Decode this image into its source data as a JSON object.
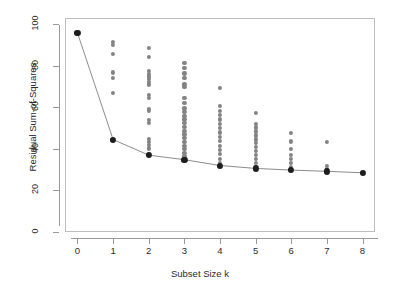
{
  "chart_data": {
    "type": "scatter",
    "title": "",
    "xlabel": "Subset Size k",
    "ylabel": "Residual Sum-of-Squares",
    "xlim": [
      -0.35,
      8.35
    ],
    "ylim": [
      0,
      103
    ],
    "grid": false,
    "legend": null,
    "xticks": [
      0,
      1,
      2,
      3,
      4,
      5,
      6,
      7,
      8
    ],
    "xtick_labels": [
      "0",
      "1",
      "2",
      "3",
      "4",
      "5",
      "6",
      "7",
      "8"
    ],
    "yticks": [
      0,
      20,
      40,
      60,
      80,
      100
    ],
    "ytick_labels": [
      "0",
      "20",
      "40",
      "60",
      "80",
      "100"
    ],
    "series": [
      {
        "name": "all-subsets-rss",
        "marker": "filled-circle",
        "color": "#838383",
        "points": [
          {
            "k": 0,
            "rss": 95.8
          },
          {
            "k": 1,
            "rss": 91.5
          },
          {
            "k": 1,
            "rss": 90.2
          },
          {
            "k": 1,
            "rss": 85.6
          },
          {
            "k": 1,
            "rss": 76.8
          },
          {
            "k": 1,
            "rss": 74.1
          },
          {
            "k": 1,
            "rss": 67.1
          },
          {
            "k": 1,
            "rss": 44.5
          },
          {
            "k": 2,
            "rss": 88.5
          },
          {
            "k": 2,
            "rss": 84.4
          },
          {
            "k": 2,
            "rss": 77.6
          },
          {
            "k": 2,
            "rss": 76.2
          },
          {
            "k": 2,
            "rss": 74.9
          },
          {
            "k": 2,
            "rss": 73.6
          },
          {
            "k": 2,
            "rss": 72.3
          },
          {
            "k": 2,
            "rss": 71.0
          },
          {
            "k": 2,
            "rss": 66.0
          },
          {
            "k": 2,
            "rss": 64.7
          },
          {
            "k": 2,
            "rss": 59.4
          },
          {
            "k": 2,
            "rss": 58.1
          },
          {
            "k": 2,
            "rss": 54.0
          },
          {
            "k": 2,
            "rss": 52.7
          },
          {
            "k": 2,
            "rss": 44.7
          },
          {
            "k": 2,
            "rss": 43.4
          },
          {
            "k": 2,
            "rss": 42.1
          },
          {
            "k": 2,
            "rss": 40.2
          },
          {
            "k": 2,
            "rss": 37.0
          },
          {
            "k": 3,
            "rss": 81.5
          },
          {
            "k": 3,
            "rss": 78.9
          },
          {
            "k": 3,
            "rss": 76.3
          },
          {
            "k": 3,
            "rss": 74.0
          },
          {
            "k": 3,
            "rss": 71.0
          },
          {
            "k": 3,
            "rss": 69.7
          },
          {
            "k": 3,
            "rss": 64.4
          },
          {
            "k": 3,
            "rss": 62.0
          },
          {
            "k": 3,
            "rss": 59.5
          },
          {
            "k": 3,
            "rss": 57.8
          },
          {
            "k": 3,
            "rss": 56.0
          },
          {
            "k": 3,
            "rss": 54.2
          },
          {
            "k": 3,
            "rss": 52.4
          },
          {
            "k": 3,
            "rss": 50.6
          },
          {
            "k": 3,
            "rss": 48.8
          },
          {
            "k": 3,
            "rss": 47.0
          },
          {
            "k": 3,
            "rss": 45.2
          },
          {
            "k": 3,
            "rss": 43.4
          },
          {
            "k": 3,
            "rss": 41.6
          },
          {
            "k": 3,
            "rss": 39.8
          },
          {
            "k": 3,
            "rss": 38.0
          },
          {
            "k": 3,
            "rss": 36.4
          },
          {
            "k": 3,
            "rss": 34.8
          },
          {
            "k": 4,
            "rss": 69.5
          },
          {
            "k": 4,
            "rss": 60.5
          },
          {
            "k": 4,
            "rss": 58.4
          },
          {
            "k": 4,
            "rss": 56.3
          },
          {
            "k": 4,
            "rss": 54.2
          },
          {
            "k": 4,
            "rss": 52.1
          },
          {
            "k": 4,
            "rss": 50.0
          },
          {
            "k": 4,
            "rss": 47.9
          },
          {
            "k": 4,
            "rss": 45.8
          },
          {
            "k": 4,
            "rss": 43.7
          },
          {
            "k": 4,
            "rss": 41.6
          },
          {
            "k": 4,
            "rss": 39.5
          },
          {
            "k": 4,
            "rss": 37.4
          },
          {
            "k": 4,
            "rss": 35.3
          },
          {
            "k": 4,
            "rss": 33.2
          },
          {
            "k": 4,
            "rss": 32.0
          },
          {
            "k": 5,
            "rss": 57.2
          },
          {
            "k": 5,
            "rss": 52.1
          },
          {
            "k": 5,
            "rss": 50.3
          },
          {
            "k": 5,
            "rss": 48.4
          },
          {
            "k": 5,
            "rss": 46.5
          },
          {
            "k": 5,
            "rss": 44.6
          },
          {
            "k": 5,
            "rss": 42.7
          },
          {
            "k": 5,
            "rss": 40.8
          },
          {
            "k": 5,
            "rss": 38.9
          },
          {
            "k": 5,
            "rss": 37.0
          },
          {
            "k": 5,
            "rss": 35.1
          },
          {
            "k": 5,
            "rss": 33.2
          },
          {
            "k": 5,
            "rss": 31.4
          },
          {
            "k": 5,
            "rss": 30.6
          },
          {
            "k": 6,
            "rss": 47.5
          },
          {
            "k": 6,
            "rss": 43.6
          },
          {
            "k": 6,
            "rss": 40.1
          },
          {
            "k": 6,
            "rss": 37.3
          },
          {
            "k": 6,
            "rss": 35.0
          },
          {
            "k": 6,
            "rss": 33.2
          },
          {
            "k": 6,
            "rss": 31.5
          },
          {
            "k": 6,
            "rss": 29.8
          },
          {
            "k": 7,
            "rss": 43.5
          },
          {
            "k": 7,
            "rss": 31.8
          },
          {
            "k": 7,
            "rss": 30.2
          },
          {
            "k": 7,
            "rss": 29.2
          },
          {
            "k": 8,
            "rss": 28.5
          }
        ]
      },
      {
        "name": "best-subset-path",
        "marker": "filled-circle-large",
        "color": "#1d1d1d",
        "line_color": "#8c8c8c",
        "points": [
          {
            "k": 0,
            "rss": 95.8
          },
          {
            "k": 1,
            "rss": 44.5
          },
          {
            "k": 2,
            "rss": 37.0
          },
          {
            "k": 3,
            "rss": 34.8
          },
          {
            "k": 4,
            "rss": 32.0
          },
          {
            "k": 5,
            "rss": 30.6
          },
          {
            "k": 6,
            "rss": 29.8
          },
          {
            "k": 7,
            "rss": 29.2
          },
          {
            "k": 8,
            "rss": 28.5
          }
        ]
      }
    ]
  }
}
